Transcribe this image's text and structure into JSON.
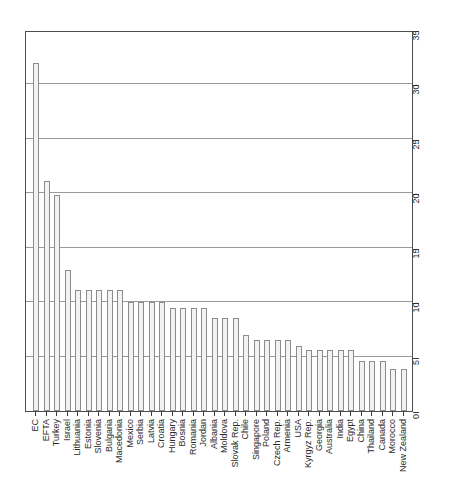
{
  "chart_data": {
    "type": "bar",
    "title": "",
    "xlabel": "",
    "ylabel": "",
    "ylim": [
      0,
      35
    ],
    "yticks": [
      0,
      5,
      10,
      15,
      20,
      25,
      30,
      35
    ],
    "grid": true,
    "legend": false,
    "orientation": "vertical",
    "categories": [
      "EC",
      "EFTA",
      "Turkey",
      "Israel",
      "Lithuania",
      "Estonia",
      "Slovenia",
      "Bulgaria",
      "Macedonia",
      "Mexico",
      "Serbia",
      "Latvia",
      "Croatia",
      "Hungary",
      "Bosnia",
      "Romania",
      "Jordan",
      "Albania",
      "Moldova",
      "Slovak Rep.",
      "Chile",
      "Singapore",
      "Poland",
      "Czech Rep.",
      "Armenia",
      "USA",
      "Kyrgyz Rep.",
      "Georgia",
      "Australia",
      "India",
      "Egypt",
      "China",
      "Thailand",
      "Canada",
      "Morocco",
      "New Zealand"
    ],
    "values": [
      32.0,
      21.1,
      19.8,
      13.0,
      11.1,
      11.1,
      11.1,
      11.1,
      11.1,
      10.0,
      10.0,
      10.0,
      10.0,
      9.5,
      9.5,
      9.5,
      9.5,
      8.5,
      8.5,
      8.5,
      7.0,
      6.5,
      6.5,
      6.5,
      6.5,
      6.0,
      5.6,
      5.6,
      5.6,
      5.6,
      5.6,
      4.6,
      4.6,
      4.6,
      3.9,
      3.9
    ]
  },
  "axes": {
    "y_tick_labels": [
      "0",
      "5",
      "10",
      "15",
      "20",
      "25",
      "30",
      "35"
    ]
  }
}
